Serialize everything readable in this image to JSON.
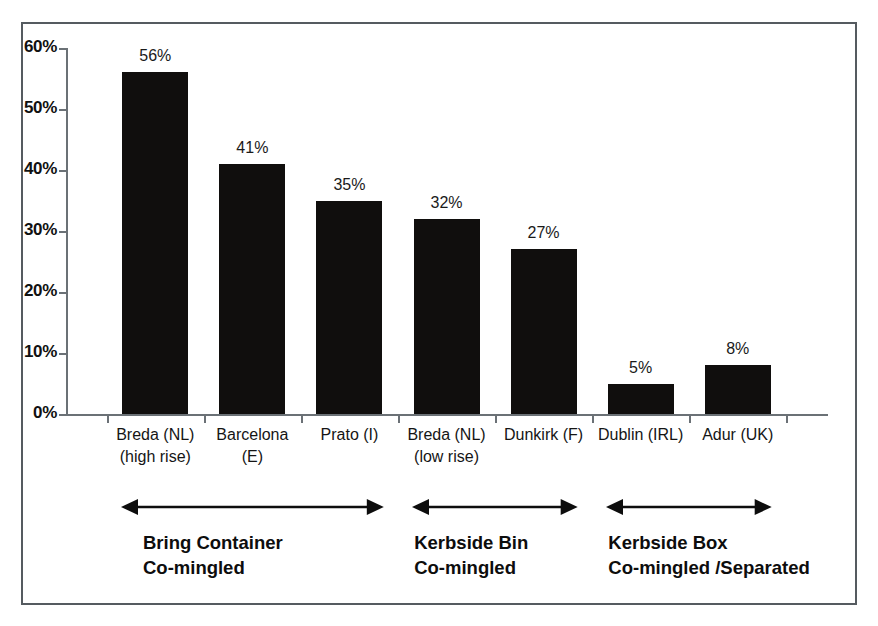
{
  "chart_data": {
    "type": "bar",
    "title": "",
    "subtitle": "",
    "xlabel": "",
    "ylabel": "",
    "ylim": [
      0,
      60
    ],
    "grid": false,
    "legend": "none",
    "categories": [
      "Breda (NL) (high rise)",
      "Barcelona (E)",
      "Prato (I)",
      "Breda (NL) (low rise)",
      "Dunkirk (F)",
      "Dublin  (IRL)",
      "Adur (UK)"
    ],
    "values": [
      56,
      41,
      35,
      32,
      27,
      5,
      8
    ],
    "value_labels": [
      "56%",
      "41%",
      "35%",
      "32%",
      "27%",
      "5%",
      "8%"
    ],
    "y_ticks": [
      0,
      10,
      20,
      30,
      40,
      50,
      60
    ],
    "y_tick_labels": [
      "0%",
      "10%",
      "20%",
      "30%",
      "40%",
      "50%",
      "60%"
    ],
    "bar_color": "#100e0d",
    "axis_color": "#6b7176",
    "frame_color": "#555b60",
    "category_lines": [
      {
        "line1": "Breda (NL)",
        "line2": "(high rise)"
      },
      {
        "line1": "Barcelona",
        "line2": "(E)"
      },
      {
        "line1": "Prato (I)",
        "line2": ""
      },
      {
        "line1": "Breda (NL)",
        "line2": "(low rise)"
      },
      {
        "line1": "Dunkirk (F)",
        "line2": ""
      },
      {
        "line1": "Dublin  (IRL)",
        "line2": ""
      },
      {
        "line1": "Adur (UK)",
        "line2": ""
      }
    ],
    "groups": [
      {
        "id": "bring-container",
        "line1": "Bring  Container",
        "line2": "Co-mingled",
        "span_categories": [
          0,
          2
        ]
      },
      {
        "id": "kerbside-bin",
        "line1": "Kerbside Bin",
        "line2": "Co-mingled",
        "span_categories": [
          3,
          4
        ]
      },
      {
        "id": "kerbside-box",
        "line1": "Kerbside Box",
        "line2": "Co-mingled /Separated",
        "span_categories": [
          5,
          6
        ]
      }
    ]
  }
}
